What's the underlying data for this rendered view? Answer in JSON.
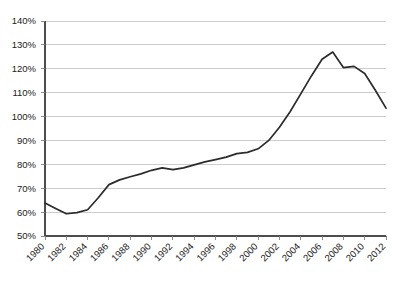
{
  "chart_data": {
    "type": "line",
    "title": "",
    "subtitle": "",
    "xlabel": "",
    "ylabel": "",
    "grid": true,
    "legend": false,
    "legend_position": "none",
    "line_color": "#2b2b2b",
    "grid_color": "#c8c8c8",
    "axis_color": "#4d4d4d",
    "xlim": [
      1980,
      2012
    ],
    "ylim": [
      50,
      140
    ],
    "y_tick_step": 10,
    "y_tick_values": [
      50,
      60,
      70,
      80,
      90,
      100,
      110,
      120,
      130,
      140
    ],
    "y_tick_labels": [
      "50%",
      "60%",
      "70%",
      "80%",
      "90%",
      "100%",
      "110%",
      "120%",
      "130%",
      "140%"
    ],
    "x_tick_values": [
      1980,
      1982,
      1984,
      1986,
      1988,
      1990,
      1992,
      1994,
      1996,
      1998,
      2000,
      2002,
      2004,
      2006,
      2008,
      2010,
      2012
    ],
    "x_tick_labels": [
      "1980",
      "1982",
      "1984",
      "1986",
      "1988",
      "1990",
      "1992",
      "1994",
      "1996",
      "1998",
      "2000",
      "2002",
      "2004",
      "2006",
      "2008",
      "2010",
      "2012"
    ],
    "x_label_rotation": -45,
    "series": [
      {
        "name": "series-1",
        "x": [
          1980,
          1981,
          1982,
          1983,
          1984,
          1985,
          1986,
          1987,
          1988,
          1989,
          1990,
          1991,
          1992,
          1993,
          1994,
          1995,
          1996,
          1997,
          1998,
          1999,
          2000,
          2001,
          2002,
          2003,
          2004,
          2005,
          2006,
          2007,
          2008,
          2009,
          2010,
          2011,
          2012
        ],
        "values": [
          63.8,
          61.5,
          59.3,
          59.8,
          61.0,
          66.0,
          71.5,
          73.5,
          74.8,
          76.0,
          77.5,
          78.5,
          77.8,
          78.5,
          79.8,
          81.0,
          82.0,
          83.0,
          84.5,
          85.0,
          86.5,
          90.0,
          95.5,
          102.0,
          109.5,
          117.0,
          124.0,
          127.0,
          120.5,
          121.0,
          118.0,
          111.0,
          103.5
        ]
      }
    ]
  },
  "plot_geometry": {
    "left": 45,
    "right": 386,
    "top": 21,
    "bottom": 236
  }
}
